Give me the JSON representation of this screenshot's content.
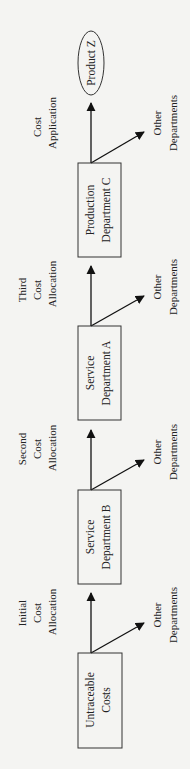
{
  "diagram": {
    "orientation": "rotated-90-ccw",
    "flow_direction": "bottom-to-top",
    "nodes": {
      "untraceable": {
        "line1": "Untraceable",
        "line2": "Costs",
        "shape": "rectangle"
      },
      "service_b": {
        "line1": "Service",
        "line2": "Department B",
        "shape": "rectangle"
      },
      "service_a": {
        "line1": "Service",
        "line2": "Department A",
        "shape": "rectangle"
      },
      "production_c": {
        "line1": "Production",
        "line2": "Department C",
        "shape": "rectangle"
      },
      "product_z": {
        "label": "Product Z",
        "shape": "ellipse"
      }
    },
    "step_labels": {
      "initial": {
        "line1": "Initial",
        "line2": "Cost",
        "line3": "Allocation"
      },
      "second": {
        "line1": "Second",
        "line2": "Cost",
        "line3": "Allocation"
      },
      "third": {
        "line1": "Third",
        "line2": "Cost",
        "line3": "Allocation"
      },
      "application": {
        "line1": "Cost",
        "line2": "Application"
      }
    },
    "side_outputs": {
      "from_untraceable": {
        "line1": "Other",
        "line2": "Departments"
      },
      "from_service_b": {
        "line1": "Other",
        "line2": "Departments"
      },
      "from_service_a": {
        "line1": "Other",
        "line2": "Departments"
      },
      "from_production_c": {
        "line1": "Other",
        "line2": "Departments"
      }
    },
    "edges": [
      {
        "from": "Untraceable Costs",
        "to": "Service Department B",
        "label": "Initial Cost Allocation"
      },
      {
        "from": "Untraceable Costs",
        "to": "Other Departments"
      },
      {
        "from": "Service Department B",
        "to": "Service Department A",
        "label": "Second Cost Allocation"
      },
      {
        "from": "Service Department B",
        "to": "Other Departments"
      },
      {
        "from": "Service Department A",
        "to": "Production Department C",
        "label": "Third Cost Allocation"
      },
      {
        "from": "Service Department A",
        "to": "Other Departments"
      },
      {
        "from": "Production Department C",
        "to": "Product Z",
        "label": "Cost Application"
      },
      {
        "from": "Production Department C",
        "to": "Other Departments"
      }
    ],
    "colors": {
      "background": "#f4f4f2",
      "stroke": "#111111",
      "text": "#222222"
    }
  }
}
